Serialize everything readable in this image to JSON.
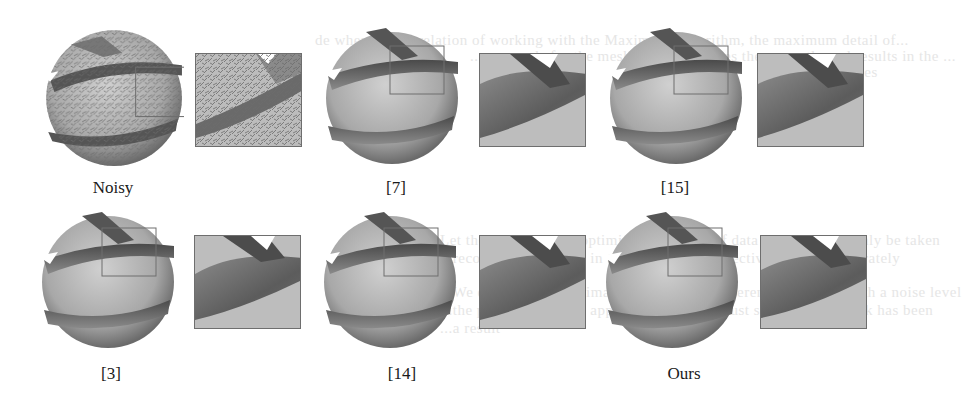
{
  "figure": {
    "ghost_text": [
      "de when the correlation of working with the Maximum Algorithm, the maximum detail of...",
      "...e normals for the mesh shape preserves the correctly and results in the ...",
      "...mean values",
      "B.  Results",
      "Let the MRF mesh is optimised by means of data visit data can only be taken",
      "...recognizes...features in the data that we effectively be can accurately",
      "...We evaluate several images of different different algorithms with a noise level",
      "...the proposed several approach that is a robust similarity network has been",
      "...a result"
    ],
    "panels": [
      {
        "label": "Noisy",
        "style": "noisy"
      },
      {
        "label": "[7]",
        "style": "smooth"
      },
      {
        "label": "[15]",
        "style": "smooth"
      },
      {
        "label": "[3]",
        "style": "smooth"
      },
      {
        "label": "[14]",
        "style": "smooth"
      },
      {
        "label": "Ours",
        "style": "smooth"
      }
    ],
    "colors": {
      "mesh_light": "#c4c4c4",
      "mesh_mid": "#9a9a9a",
      "mesh_dark": "#5a5a5a",
      "frame": "#6e6e6e",
      "label": "#1a1a1a"
    }
  }
}
